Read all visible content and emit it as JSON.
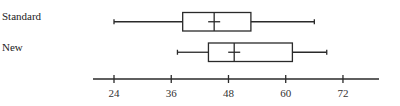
{
  "chart_data": {
    "type": "boxplot",
    "title": "",
    "xlabel": "",
    "ylabel": "",
    "orientation": "horizontal",
    "axis": {
      "ticks": [
        24,
        36,
        48,
        60,
        72
      ],
      "tick_labels": [
        "24",
        "36",
        "48",
        "60",
        "72"
      ],
      "range": [
        18.5,
        79
      ]
    },
    "grid": false,
    "legend": null,
    "series": [
      {
        "name": "Standard",
        "min": 24,
        "q1": 38.4,
        "median": 45,
        "q3": 52.7,
        "max": 66,
        "mean": 45
      },
      {
        "name": "New",
        "min": 37.3,
        "q1": 43.8,
        "median": 49.2,
        "q3": 61.4,
        "max": 68.6,
        "mean": 49.2
      }
    ]
  },
  "labels": {
    "standard": "Standard",
    "new": "New"
  },
  "style": {
    "line_color": "#2a2a2a",
    "background": "#ffffff"
  }
}
